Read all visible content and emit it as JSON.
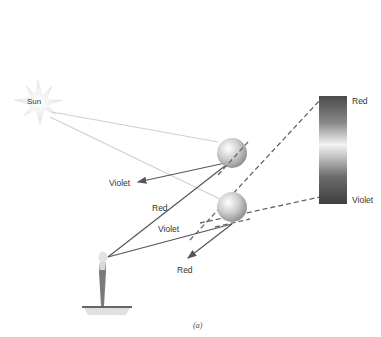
{
  "figure": {
    "caption": "(a)",
    "sun": {
      "label": "Sun"
    },
    "spectrum": {
      "top_label": "Red",
      "bottom_label": "Violet",
      "colors": {
        "top": "#555555",
        "middle": "#f2f2f2",
        "bottom": "#444444"
      }
    },
    "rays": {
      "upper_drop_violet_label": "Violet",
      "upper_drop_red_label": "Red",
      "lower_drop_violet_label": "Violet",
      "lower_drop_red_label": "Red"
    },
    "colors": {
      "sunlight": "#d0d0d0",
      "refracted_ray": "#555555",
      "dashed_line": "#666666",
      "droplet": "#bbbbbb"
    }
  }
}
